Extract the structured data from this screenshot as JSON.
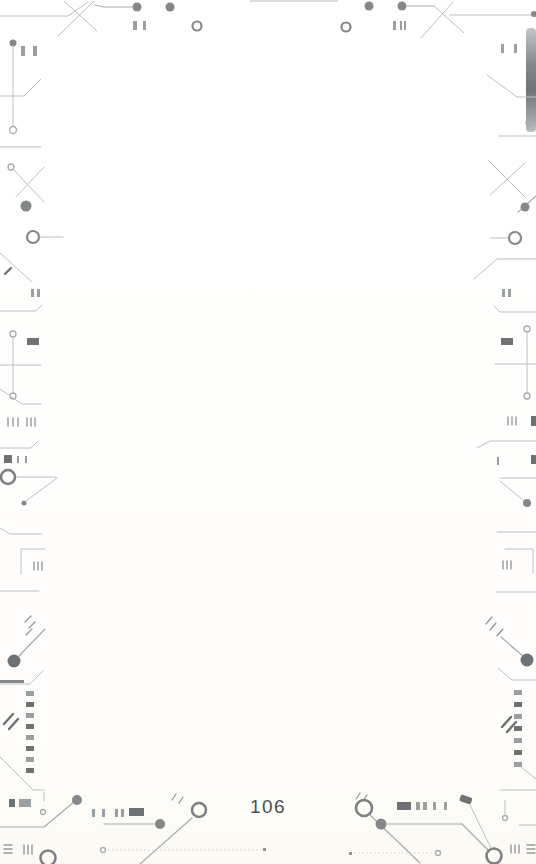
{
  "page": {
    "number": "106"
  },
  "decorations": {
    "style": "circuit-board-frame",
    "description": "Decorative printed-circuit-trace border on all four edges of an otherwise blank book page",
    "motifs": [
      "trace-lines",
      "via-dots",
      "open-rings",
      "smd-pads",
      "ic-pin-columns",
      "tick-marks",
      "crossed-diagonals",
      "edge-gradient-bar"
    ],
    "colors": {
      "background": "#ffffff",
      "trace": "#bcc0c1",
      "trace_strong": "#a7abad",
      "via_dot": "#84888b",
      "dark_element": "#6e7274",
      "pad": "#9aa0a2",
      "page_number_text": "#4c4f51"
    }
  }
}
